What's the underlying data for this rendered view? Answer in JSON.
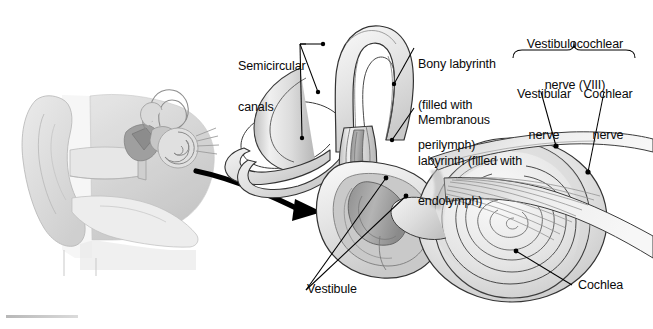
{
  "figure": {
    "domain": "anatomical-illustration",
    "background_color": "#ffffff",
    "line_color": "#1a1a1a",
    "palette": {
      "outline": "#2b2b2b",
      "bone_light": "#f2f2f2",
      "bone_mid": "#dcdcdc",
      "bone_shadow": "#bdbdbd",
      "membranous_fill": "#9e9e9e",
      "membranous_dark": "#7d7d7d",
      "inset_gray": "#d9d9d9",
      "inset_deep": "#a8a8a8",
      "arrow": "#000000",
      "caption_bar": "#b8b8b8"
    }
  },
  "labels": {
    "semicircular_canals": {
      "text": "Semicircular\ncanals",
      "line1": "Semicircular",
      "line2": "canals",
      "x": 238,
      "y": 34,
      "leader_count": 3
    },
    "bony_labyrinth": {
      "text": "Bony labyrinth\n(filled with\nperilymph)",
      "line1": "Bony labyrinth",
      "line2": "(filled with",
      "line3": "perilymph)",
      "x": 418,
      "y": 32,
      "leader_count": 1
    },
    "membranous_labyrinth": {
      "text": "Membranous\nlabyrinth (filled with\nendolymph)",
      "line1": "Membranous",
      "line2": "labyrinth (filled with",
      "line3": "endolymph)",
      "x": 418,
      "y": 88,
      "leader_count": 1
    },
    "vestibulocochlear_nerve": {
      "text": "Vestibulocochlear\nnerve (VIII)",
      "line1": "Vestibulocochlear",
      "line2": "nerve (VIII)",
      "x": 519,
      "y": 12,
      "has_brace": true
    },
    "vestibular_nerve": {
      "text": "Vestibular\nnerve",
      "line1": "Vestibular",
      "line2": "nerve",
      "x": 513,
      "y": 62,
      "leader_count": 1
    },
    "cochlear_nerve": {
      "text": "Cochlear\nnerve",
      "line1": "Cochlear",
      "line2": "nerve",
      "x": 583,
      "y": 62,
      "leader_count": 1
    },
    "vestibule": {
      "text": "Vestibule",
      "x": 311,
      "y": 283,
      "leader_count": 2
    },
    "cochlea": {
      "text": "Cochlea",
      "x": 579,
      "y": 281,
      "leader_count": 1
    }
  },
  "inset": {
    "name": "ear-overview-inset",
    "description": "Grayscale coronal section of the outer, middle and inner ear",
    "x": 10,
    "y": 55,
    "width": 210,
    "height": 205,
    "parts": [
      "pinna",
      "external-auditory-canal",
      "tympanic-membrane",
      "ossicles",
      "cochlea",
      "semicircular-canals",
      "auditory-tube"
    ]
  },
  "connector_arrow": {
    "name": "magnification-arrow",
    "description": "Thick curved black arrow from inset inner ear to enlarged labyrinth",
    "start_x": 196,
    "start_y": 171,
    "end_x": 312,
    "end_y": 215
  },
  "main_structure": {
    "name": "inner-ear-labyrinth",
    "parts": [
      {
        "name": "anterior-semicircular-canal",
        "type": "loop"
      },
      {
        "name": "posterior-semicircular-canal",
        "type": "loop"
      },
      {
        "name": "lateral-semicircular-canal",
        "type": "loop"
      },
      {
        "name": "ampullae",
        "type": "bulbs",
        "count": 3
      },
      {
        "name": "vestibule",
        "type": "chamber"
      },
      {
        "name": "cochlea",
        "type": "spiral",
        "turns": 2.5
      },
      {
        "name": "vestibular-nerve",
        "type": "nerve-band"
      },
      {
        "name": "cochlear-nerve",
        "type": "nerve-fan"
      }
    ]
  },
  "caption_bar": {
    "name": "caption-rule",
    "x": 6,
    "y": 315,
    "width": 72,
    "height": 3
  }
}
